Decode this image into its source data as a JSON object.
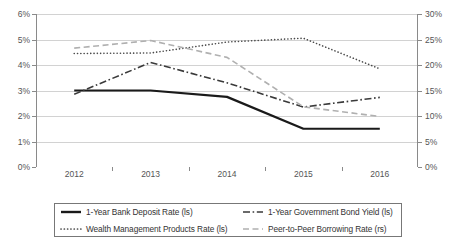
{
  "chart_data": {
    "type": "line",
    "title": "",
    "xlabel": "",
    "ylabel": "",
    "grid": true,
    "legend_position": "bottom",
    "categories": [
      "2012",
      "2013",
      "2014",
      "2015",
      "2016"
    ],
    "axes": {
      "left": {
        "id": "ls",
        "ylim": [
          0,
          6
        ],
        "step": 1,
        "unit": "%",
        "ticks": [
          "0%",
          "1%",
          "2%",
          "3%",
          "4%",
          "5%",
          "6%"
        ]
      },
      "right": {
        "id": "rs",
        "ylim": [
          0,
          30
        ],
        "step": 5,
        "unit": "%",
        "ticks": [
          "0%",
          "5%",
          "10%",
          "15%",
          "20%",
          "25%",
          "30%"
        ]
      }
    },
    "series": [
      {
        "name": "1-Year Bank Deposit Rate (ls)",
        "axis": "left",
        "style": "solid",
        "color": "#1a1a1a",
        "width": 2.2,
        "values": [
          3.0,
          3.0,
          2.75,
          1.5,
          1.5
        ]
      },
      {
        "name": "1-Year Government Bond Yield (ls)",
        "axis": "left",
        "style": "dashdot",
        "color": "#3a3a3a",
        "width": 1.6,
        "values": [
          2.85,
          4.1,
          3.3,
          2.35,
          2.73
        ]
      },
      {
        "name": "Wealth Management Products Rate (ls)",
        "axis": "left",
        "style": "dotted",
        "color": "#4a4a4a",
        "width": 1.6,
        "values": [
          4.45,
          4.47,
          4.9,
          5.05,
          3.85
        ]
      },
      {
        "name": "Peer-to-Peer Borrowing Rate (rs)",
        "axis": "right",
        "style": "dashed",
        "color": "#b0b0b0",
        "width": 1.6,
        "values": [
          23.3,
          24.8,
          21.5,
          11.8,
          9.9
        ]
      }
    ]
  },
  "legend": {
    "items": [
      {
        "label": "1-Year Bank Deposit Rate (ls)",
        "style": "solid",
        "color": "#1a1a1a"
      },
      {
        "label": "1-Year Government Bond Yield (ls)",
        "style": "dashdot",
        "color": "#3a3a3a"
      },
      {
        "label": "Wealth Management Products Rate (ls)",
        "style": "dotted",
        "color": "#4a4a4a"
      },
      {
        "label": "Peer-to-Peer Borrowing Rate (rs)",
        "style": "dashed",
        "color": "#b0b0b0"
      }
    ]
  }
}
